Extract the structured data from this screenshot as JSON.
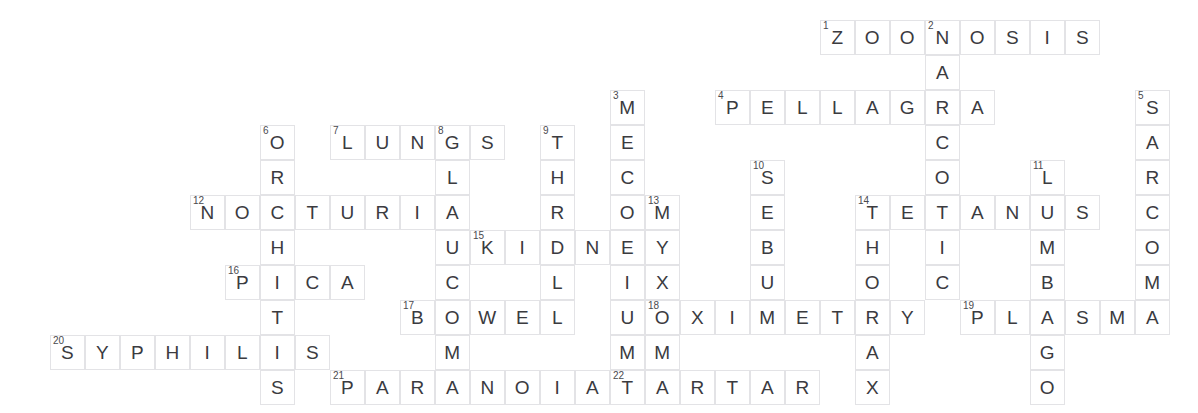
{
  "puzzle": {
    "title": "Medical Terms Crossword",
    "grid": {
      "origin_x": 50,
      "origin_y": 20,
      "cell_size": 35,
      "columns": 32,
      "rows": 11
    },
    "colors": {
      "cell_border": "#e3e3e6",
      "cell_fill": "#ffffff",
      "letter": "#3b3b3f",
      "number": "#4a4a4e",
      "page_background": "#ffffff"
    },
    "entries": [
      {
        "number": "1",
        "answer": "ZOONOSIS",
        "direction": "across",
        "row": 0,
        "col": 22
      },
      {
        "number": "2",
        "answer": "NARCOTIC",
        "direction": "down",
        "row": 0,
        "col": 25
      },
      {
        "number": "3",
        "answer": "MECONIUM",
        "direction": "down",
        "row": 2,
        "col": 16
      },
      {
        "number": "4",
        "answer": "PELLAGRA",
        "direction": "across",
        "row": 2,
        "col": 19
      },
      {
        "number": "5",
        "answer": "SARCOMA",
        "direction": "down",
        "row": 2,
        "col": 31
      },
      {
        "number": "6",
        "answer": "ORCHITIS",
        "direction": "down",
        "row": 3,
        "col": 6
      },
      {
        "number": "7",
        "answer": "LUNGS",
        "direction": "across",
        "row": 3,
        "col": 8
      },
      {
        "number": "8",
        "answer": "GLAUCOMA",
        "direction": "down",
        "row": 3,
        "col": 11
      },
      {
        "number": "9",
        "answer": "THRILL",
        "direction": "down",
        "row": 3,
        "col": 14
      },
      {
        "number": "10",
        "answer": "SEBUM",
        "direction": "down",
        "row": 4,
        "col": 20
      },
      {
        "number": "11",
        "answer": "LUMBAGO",
        "direction": "down",
        "row": 4,
        "col": 28
      },
      {
        "number": "12",
        "answer": "NOCTURIA",
        "direction": "across",
        "row": 5,
        "col": 4
      },
      {
        "number": "13",
        "answer": "MYXOMA",
        "direction": "down",
        "row": 5,
        "col": 17
      },
      {
        "number": "14",
        "answer": "TETANUS",
        "direction": "across",
        "row": 5,
        "col": 23
      },
      {
        "number": "14",
        "answer": "THORAX",
        "direction": "down",
        "row": 5,
        "col": 23
      },
      {
        "number": "15",
        "answer": "KIDNEY",
        "direction": "across",
        "row": 6,
        "col": 12
      },
      {
        "number": "16",
        "answer": "PICA",
        "direction": "across",
        "row": 7,
        "col": 5
      },
      {
        "number": "17",
        "answer": "BOWEL",
        "direction": "across",
        "row": 8,
        "col": 10
      },
      {
        "number": "18",
        "answer": "OXIMETRY",
        "direction": "across",
        "row": 8,
        "col": 17
      },
      {
        "number": "19",
        "answer": "PLASMA",
        "direction": "across",
        "row": 8,
        "col": 26
      },
      {
        "number": "20",
        "answer": "SYPHILIS",
        "direction": "across",
        "row": 9,
        "col": 0
      },
      {
        "number": "21",
        "answer": "PARANOIA",
        "direction": "across",
        "row": 10,
        "col": 8
      },
      {
        "number": "22",
        "answer": "TARTAR",
        "direction": "across",
        "row": 10,
        "col": 16
      }
    ]
  }
}
